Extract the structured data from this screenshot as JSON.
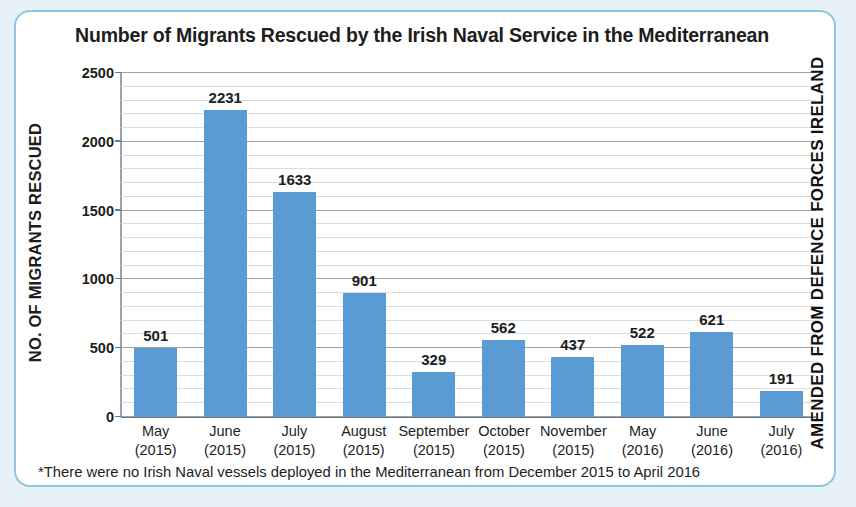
{
  "card": {
    "border_color": "#8fc4e2",
    "background": "#ffffff",
    "page_background": "#e6f1f8"
  },
  "title": "Number of Migrants Rescued by the Irish Naval Service in the Mediterranean",
  "credit": "AMENDED FROM DEFENCE FORCES IRELAND",
  "yaxis_title": "NO. OF MIGRANTS RESCUED",
  "footnote": "*There were no Irish Naval vessels deployed in the Mediterranean from December 2015 to April 2016",
  "yticks": [
    "0",
    "500",
    "1000",
    "1500",
    "2000",
    "2500"
  ],
  "bar_color": "#5b9bd5",
  "chart_data": {
    "type": "bar",
    "title": "Number of Migrants Rescued by the Irish Naval Service in the Mediterranean",
    "xlabel": "",
    "ylabel": "NO. OF MIGRANTS RESCUED",
    "ylim": [
      0,
      2500
    ],
    "ytick_step": 500,
    "minor_gridline_step": 100,
    "grid": true,
    "legend": false,
    "categories": [
      "May (2015)",
      "June (2015)",
      "July (2015)",
      "August (2015)",
      "September (2015)",
      "October (2015)",
      "November (2015)",
      "May (2016)",
      "June (2016)",
      "July (2016)"
    ],
    "category_months": [
      "May",
      "June",
      "July",
      "August",
      "September",
      "October",
      "November",
      "May",
      "June",
      "July"
    ],
    "category_years": [
      "(2015)",
      "(2015)",
      "(2015)",
      "(2015)",
      "(2015)",
      "(2015)",
      "(2015)",
      "(2016)",
      "(2016)",
      "(2016)"
    ],
    "values": [
      501,
      2231,
      1633,
      901,
      329,
      562,
      437,
      522,
      621,
      191
    ],
    "data_labels": [
      "501",
      "2231",
      "1633",
      "901",
      "329",
      "562",
      "437",
      "522",
      "621",
      "191"
    ],
    "annotation": "*There were no Irish Naval vessels deployed in the Mediterranean from December 2015 to April 2016"
  }
}
